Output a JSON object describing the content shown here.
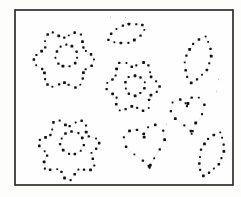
{
  "canvas": {
    "width": 241,
    "height": 197,
    "background": "#fdfdfb"
  },
  "frame": {
    "x": 15,
    "y": 10,
    "width": 218,
    "height": 175,
    "stroke": "#2e2e2e",
    "stroke_width": 1.7,
    "fill": "#fefefe"
  },
  "style": {
    "dot_color": "#121212",
    "dot_base_size": 1.9,
    "dot_size_step": 0.22,
    "jitter": 1.1,
    "guide_color": "rgba(0,0,0,0.13)",
    "guide_width": 0.5,
    "speck_color": "#b9b9b4"
  },
  "shapes": [
    {
      "name": "flower-outline-top-left",
      "type": "flower",
      "cx": 64,
      "cy": 60,
      "radius": 30.5,
      "petals": 6,
      "amplitude": 0.13,
      "phase": 0,
      "dots": 32
    },
    {
      "name": "flower-center-top-left",
      "type": "circle",
      "cx": 66.5,
      "cy": 56,
      "radius": 11,
      "dots": 11
    },
    {
      "name": "leaf-top-middle",
      "type": "leaf",
      "cx": 127,
      "cy": 33.5,
      "length": 40,
      "width": 18,
      "angle": -19,
      "dots": 13
    },
    {
      "name": "flower-outline-middle",
      "type": "flower",
      "cx": 133,
      "cy": 86.5,
      "radius": 27,
      "petals": 6,
      "amplitude": 0.13,
      "phase": 0,
      "dots": 27
    },
    {
      "name": "flower-center-middle",
      "type": "circle",
      "cx": 135,
      "cy": 85.5,
      "radius": 10,
      "dots": 10
    },
    {
      "name": "leaf-right",
      "type": "leaf",
      "cx": 198,
      "cy": 59.5,
      "length": 49,
      "width": 24,
      "angle": 107,
      "dots": 16
    },
    {
      "name": "heart-right",
      "type": "heart",
      "cx": 189,
      "cy": 117,
      "width": 34,
      "height": 34,
      "angle": -10,
      "dots": 16
    },
    {
      "name": "flower-outline-bottom-left",
      "type": "flower",
      "cx": 69,
      "cy": 149,
      "radius": 31,
      "petals": 7,
      "amplitude": 0.13,
      "phase": 90,
      "dots": 33
    },
    {
      "name": "flower-center-bottom-left",
      "type": "circle",
      "cx": 72,
      "cy": 143,
      "radius": 11.5,
      "dots": 11
    },
    {
      "name": "heart-bottom-middle",
      "type": "heart",
      "cx": 146.5,
      "cy": 149,
      "width": 41,
      "height": 39,
      "angle": -11,
      "dots": 18
    },
    {
      "name": "leaf-bottom-right",
      "type": "leaf",
      "cx": 211.5,
      "cy": 154,
      "length": 47,
      "width": 22,
      "angle": 111,
      "dots": 16
    }
  ],
  "specks": [
    {
      "x": 110,
      "y": 16.5
    },
    {
      "x": 125,
      "y": 17
    },
    {
      "x": 218,
      "y": 79
    },
    {
      "x": 216,
      "y": 91
    },
    {
      "x": 166,
      "y": 124
    }
  ]
}
